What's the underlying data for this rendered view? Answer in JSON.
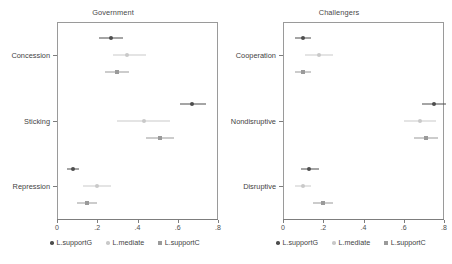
{
  "figure": {
    "width": 452,
    "height": 264,
    "background": "#ffffff"
  },
  "legend": {
    "entries": [
      {
        "label": "L.supportG",
        "color": "#4d4d4d",
        "marker": "circle"
      },
      {
        "label": "L.mediate",
        "color": "#c9c9c9",
        "marker": "circle"
      },
      {
        "label": "L.supportC",
        "color": "#9a9a9a",
        "marker": "square"
      }
    ]
  },
  "axis": {
    "ticks": [
      "0",
      ".2",
      ".4",
      ".6",
      ".8"
    ],
    "tick_values": [
      0,
      0.2,
      0.4,
      0.6,
      0.8
    ],
    "xmin": 0,
    "xmax": 0.8
  },
  "chart_data": {
    "type": "scatter",
    "title": "",
    "xlabel": "",
    "ylabel": "",
    "xlim": [
      0,
      0.8
    ],
    "grid": false,
    "legend_position": "bottom",
    "panels": [
      {
        "title": "Government",
        "categories": [
          "Concession",
          "Sticking",
          "Repression"
        ],
        "series": [
          {
            "name": "L.supportG",
            "color": "#4d4d4d",
            "marker": "circle",
            "values": [
              0.27,
              0.67,
              0.08
            ],
            "ci_low": [
              0.21,
              0.61,
              0.05
            ],
            "ci_high": [
              0.33,
              0.74,
              0.11
            ]
          },
          {
            "name": "L.mediate",
            "color": "#c9c9c9",
            "marker": "circle",
            "values": [
              0.35,
              0.43,
              0.2
            ],
            "ci_low": [
              0.28,
              0.3,
              0.13
            ],
            "ci_high": [
              0.44,
              0.56,
              0.27
            ]
          },
          {
            "name": "L.supportC",
            "color": "#9a9a9a",
            "marker": "square",
            "values": [
              0.3,
              0.51,
              0.15
            ],
            "ci_low": [
              0.24,
              0.44,
              0.1
            ],
            "ci_high": [
              0.36,
              0.58,
              0.2
            ]
          }
        ]
      },
      {
        "title": "Challengers",
        "categories": [
          "Cooperation",
          "Nondisruptive",
          "Disruptive"
        ],
        "series": [
          {
            "name": "L.supportG",
            "color": "#4d4d4d",
            "marker": "circle",
            "values": [
              0.1,
              0.75,
              0.13
            ],
            "ci_low": [
              0.06,
              0.69,
              0.09
            ],
            "ci_high": [
              0.14,
              0.81,
              0.18
            ]
          },
          {
            "name": "L.mediate",
            "color": "#c9c9c9",
            "marker": "circle",
            "values": [
              0.18,
              0.68,
              0.1
            ],
            "ci_low": [
              0.11,
              0.6,
              0.06
            ],
            "ci_high": [
              0.25,
              0.76,
              0.14
            ]
          },
          {
            "name": "L.supportC",
            "color": "#9a9a9a",
            "marker": "square",
            "values": [
              0.1,
              0.71,
              0.2
            ],
            "ci_low": [
              0.06,
              0.65,
              0.15
            ],
            "ci_high": [
              0.14,
              0.77,
              0.25
            ]
          }
        ]
      }
    ]
  }
}
